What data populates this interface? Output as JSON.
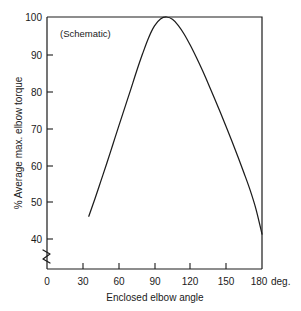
{
  "chart_data": {
    "type": "line",
    "title": "",
    "subtitle": "",
    "annotation": "(Schematic)",
    "xlabel": "Enclosed elbow angle",
    "ylabel": "% Average max. elbow torque",
    "x_unit": "deg.",
    "xlim": [
      0,
      180
    ],
    "ylim": [
      35,
      100
    ],
    "y_axis_broken": true,
    "y_break_below": 40,
    "grid": false,
    "legend": false,
    "legend_position": "none",
    "xticks": [
      0,
      30,
      60,
      90,
      120,
      150,
      180
    ],
    "xticklabels": [
      "0",
      "30",
      "60",
      "90",
      "120",
      "150",
      "180"
    ],
    "yticks": [
      40,
      50,
      60,
      70,
      80,
      90,
      100
    ],
    "yticklabels": [
      "40",
      "50",
      "60",
      "70",
      "80",
      "90",
      "100"
    ],
    "series": [
      {
        "name": "Average max. elbow torque",
        "x": [
          35,
          40,
          45,
          50,
          55,
          60,
          65,
          70,
          75,
          80,
          85,
          90,
          95,
          100,
          105,
          110,
          115,
          120,
          125,
          130,
          135,
          140,
          145,
          150,
          155,
          160,
          165,
          170,
          175,
          180
        ],
        "y": [
          48.6,
          53.0,
          57.6,
          62.2,
          67.0,
          71.8,
          76.5,
          81.2,
          86.0,
          90.5,
          94.6,
          97.7,
          99.5,
          100.0,
          99.4,
          97.8,
          95.5,
          92.7,
          89.6,
          86.3,
          82.8,
          79.2,
          75.5,
          71.7,
          67.8,
          63.8,
          59.7,
          55.4,
          50.4,
          44.0
        ]
      }
    ],
    "curve_color": "#1c1c1c",
    "peak": {
      "x": 100,
      "y": 100
    },
    "start_point": {
      "x": 35,
      "y": 48.6
    },
    "end_point": {
      "x": 180,
      "y": 44.0
    }
  },
  "figure": {
    "background_color": "#ffffff",
    "axis_color": "#1c1c1c"
  }
}
